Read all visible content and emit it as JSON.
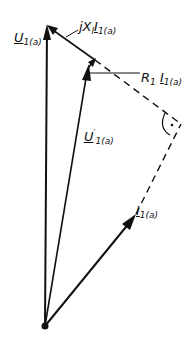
{
  "diagram": {
    "type": "phasor-diagram",
    "stroke_color": "#111111",
    "background": "#ffffff",
    "points": {
      "origin": [
        45,
        326
      ],
      "U1a_tip": [
        47,
        25
      ],
      "Uprime_tip": [
        95,
        60
      ],
      "right_angle_corner": [
        181,
        124
      ],
      "I1a_tip": [
        133,
        218
      ]
    },
    "labels": {
      "U1a": {
        "main": "U",
        "sub": "1(a)"
      },
      "jXI": {
        "prefix": "jX",
        "sub1": "l",
        "main": "I",
        "sub2": "1(a)"
      },
      "RI": {
        "prefix": "R",
        "sub1": "1",
        "main": "I",
        "sub2": "1(a)"
      },
      "Uprime": {
        "main": "U",
        "sup": "′",
        "sub": "1(a)"
      },
      "I1a": {
        "main": "I",
        "sub": "1(a)"
      }
    },
    "phasors": [
      {
        "name": "U1(a)",
        "from": "origin",
        "to": "U1a_tip",
        "style": "solid-arrow"
      },
      {
        "name": "U'1(a)",
        "from": "origin",
        "to": "Uprime_tip",
        "style": "solid-arrow"
      },
      {
        "name": "I1(a)",
        "from": "origin",
        "to": "I1a_tip",
        "style": "solid-arrow"
      },
      {
        "name": "jXl I1(a)",
        "from": "Uprime_tip",
        "to": "U1a_tip",
        "style": "solid-arrow"
      },
      {
        "name": "R1 I1(a)",
        "from": "Uprime_tip",
        "to": "Uprime_tip",
        "style": "short-arrow"
      },
      {
        "name": "extension-1",
        "from": "Uprime_tip",
        "to": "right_angle_corner",
        "style": "dashed"
      },
      {
        "name": "extension-2",
        "from": "I1a_tip",
        "to": "right_angle_corner",
        "style": "dashed"
      }
    ],
    "annotations": [
      "right-angle-marker-with-dot"
    ]
  }
}
